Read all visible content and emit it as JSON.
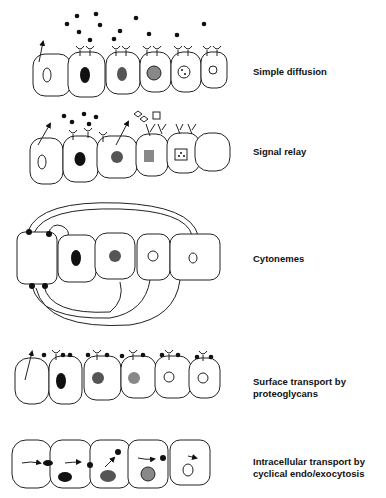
{
  "labels": {
    "simple_diffusion": "Simple diffusion",
    "signal_relay": "Signal relay",
    "cytonemes": "Cytonemes",
    "surface_transport_1": "Surface transport by",
    "surface_transport_2": "proteoglycans",
    "intracellular_1": "Intracellular transport by",
    "intracellular_2": "cyclical endo/exocytosis"
  },
  "colors": {
    "nucleus_black": "#111111",
    "nucleus_dark": "#555555",
    "nucleus_mid": "#888888",
    "outline": "#222222"
  }
}
